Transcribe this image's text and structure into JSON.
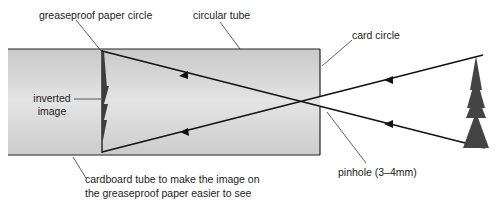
{
  "diagram": {
    "labels": {
      "greaseproof": "greaseproof paper circle",
      "tube": "circular tube",
      "card": "card circle",
      "inverted_line1": "inverted",
      "inverted_line2": "image",
      "cardboard_line1": "cardboard tube to make the image on",
      "cardboard_line2": "the greaseproof paper easier to see",
      "pinhole": "pinhole (3–4mm)"
    },
    "colors": {
      "tube_fill": "#d6d6d6",
      "line": "#1a1a1a",
      "object": "#444444"
    }
  }
}
